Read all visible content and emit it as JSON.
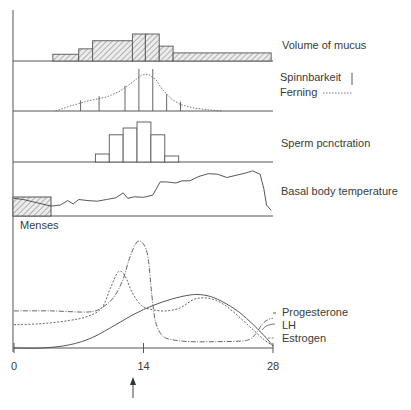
{
  "axis": {
    "x_min_day": 0,
    "x_max_day": 28,
    "ticks": [
      "0",
      "14",
      "28"
    ],
    "tick_days": [
      0,
      14,
      28
    ],
    "ovulation_marker_day": 14
  },
  "panels": {
    "mucus": {
      "label": "Volume of mucus",
      "bars": [
        {
          "start": 4.2,
          "end": 7.0,
          "value": 0.25
        },
        {
          "start": 7.0,
          "end": 8.5,
          "value": 0.45
        },
        {
          "start": 8.5,
          "end": 12.8,
          "value": 0.75
        },
        {
          "start": 12.8,
          "end": 14.2,
          "value": 1.0
        },
        {
          "start": 14.2,
          "end": 15.7,
          "value": 1.0
        },
        {
          "start": 15.7,
          "end": 17.2,
          "value": 0.55
        },
        {
          "start": 17.2,
          "end": 27.8,
          "value": 0.3
        }
      ]
    },
    "spinnbarkeit": {
      "label_spinn": "Spinnbarkeit",
      "label_ferning": "Ferning",
      "lines": [
        {
          "day": 7.2,
          "value": 0.25
        },
        {
          "day": 9.2,
          "value": 0.35
        },
        {
          "day": 12.0,
          "value": 0.6
        },
        {
          "day": 13.5,
          "value": 1.0
        },
        {
          "day": 15.0,
          "value": 1.0
        },
        {
          "day": 16.5,
          "value": 0.4
        },
        {
          "day": 18.0,
          "value": 0.22
        }
      ],
      "ferning_curve": [
        [
          4.5,
          0.0
        ],
        [
          6,
          0.12
        ],
        [
          8,
          0.25
        ],
        [
          10,
          0.35
        ],
        [
          11.5,
          0.5
        ],
        [
          12.8,
          0.72
        ],
        [
          13.8,
          0.9
        ],
        [
          14.5,
          0.92
        ],
        [
          15.3,
          0.8
        ],
        [
          16,
          0.55
        ],
        [
          17,
          0.3
        ],
        [
          18,
          0.16
        ],
        [
          19.5,
          0.07
        ],
        [
          21,
          0.03
        ],
        [
          22.5,
          0.0
        ]
      ]
    },
    "sperm": {
      "label": "Sperm pcnctration",
      "bars": [
        {
          "start": 8.8,
          "end": 10.3,
          "value": 0.2
        },
        {
          "start": 10.3,
          "end": 11.8,
          "value": 0.68
        },
        {
          "start": 11.8,
          "end": 13.3,
          "value": 0.85
        },
        {
          "start": 13.3,
          "end": 14.8,
          "value": 1.0
        },
        {
          "start": 14.8,
          "end": 16.3,
          "value": 0.68
        },
        {
          "start": 16.3,
          "end": 17.8,
          "value": 0.15
        }
      ]
    },
    "bbt": {
      "label": "Basal body temperature",
      "menses_label": "Menses",
      "menses_end_day": 4.0,
      "curve": [
        [
          0,
          0.32
        ],
        [
          1,
          0.3
        ],
        [
          2,
          0.26
        ],
        [
          3,
          0.22
        ],
        [
          4,
          0.18
        ],
        [
          5,
          0.2
        ],
        [
          5.8,
          0.28
        ],
        [
          6.4,
          0.22
        ],
        [
          7.0,
          0.3
        ],
        [
          8,
          0.28
        ],
        [
          9,
          0.27
        ],
        [
          10,
          0.3
        ],
        [
          11,
          0.33
        ],
        [
          11.8,
          0.42
        ],
        [
          12.3,
          0.32
        ],
        [
          13,
          0.35
        ],
        [
          14,
          0.34
        ],
        [
          15,
          0.38
        ],
        [
          15.8,
          0.62
        ],
        [
          16.5,
          0.62
        ],
        [
          17.5,
          0.6
        ],
        [
          18.2,
          0.64
        ],
        [
          19,
          0.64
        ],
        [
          20,
          0.72
        ],
        [
          21,
          0.77
        ],
        [
          22,
          0.76
        ],
        [
          23,
          0.7
        ],
        [
          24,
          0.74
        ],
        [
          25,
          0.78
        ],
        [
          25.8,
          0.82
        ],
        [
          26.6,
          0.76
        ],
        [
          27,
          0.5
        ],
        [
          27.3,
          0.2
        ],
        [
          27.8,
          0.1
        ]
      ]
    },
    "hormones": {
      "legend": [
        "Progesterone",
        "LH",
        "Estrogen"
      ],
      "estrogen": [
        [
          0,
          0.22
        ],
        [
          3,
          0.23
        ],
        [
          6,
          0.26
        ],
        [
          8,
          0.3
        ],
        [
          9.5,
          0.38
        ],
        [
          10.5,
          0.58
        ],
        [
          11.3,
          0.72
        ],
        [
          12,
          0.68
        ],
        [
          12.8,
          0.52
        ],
        [
          13.8,
          0.4
        ],
        [
          15,
          0.36
        ],
        [
          16.5,
          0.35
        ],
        [
          18,
          0.38
        ],
        [
          19.5,
          0.46
        ],
        [
          21,
          0.47
        ],
        [
          22.5,
          0.42
        ],
        [
          24,
          0.32
        ],
        [
          25.5,
          0.2
        ],
        [
          27,
          0.08
        ],
        [
          28,
          0.02
        ]
      ],
      "lh": [
        [
          0,
          0.35
        ],
        [
          4,
          0.35
        ],
        [
          8,
          0.34
        ],
        [
          9.5,
          0.38
        ],
        [
          10.8,
          0.48
        ],
        [
          11.8,
          0.65
        ],
        [
          12.5,
          0.85
        ],
        [
          13.3,
          1.0
        ],
        [
          14.0,
          0.98
        ],
        [
          14.5,
          0.85
        ],
        [
          14.9,
          0.5
        ],
        [
          15.3,
          0.25
        ],
        [
          16,
          0.12
        ],
        [
          17,
          0.08
        ],
        [
          19,
          0.06
        ],
        [
          22,
          0.06
        ],
        [
          25,
          0.07
        ],
        [
          26,
          0.12
        ],
        [
          26.8,
          0.22
        ],
        [
          27.5,
          0.27
        ],
        [
          28,
          0.28
        ]
      ],
      "progesterone": [
        [
          0,
          0.0
        ],
        [
          3,
          0.0
        ],
        [
          6,
          0.03
        ],
        [
          8.5,
          0.1
        ],
        [
          11,
          0.22
        ],
        [
          13,
          0.32
        ],
        [
          15,
          0.4
        ],
        [
          17,
          0.46
        ],
        [
          19,
          0.5
        ],
        [
          20.5,
          0.5
        ],
        [
          22,
          0.46
        ],
        [
          24,
          0.36
        ],
        [
          25.5,
          0.25
        ],
        [
          27,
          0.12
        ],
        [
          28,
          0.02
        ]
      ]
    }
  }
}
